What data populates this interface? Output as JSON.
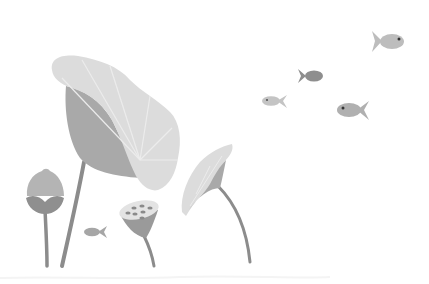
{
  "scene": {
    "description": "Grayscale illustration of lotus leaves, lotus bud, lotus seed pod and small fish",
    "background": "#ffffff",
    "colors": {
      "leaf_light": "#dcdcdc",
      "leaf_vein": "#ececec",
      "leaf_dark": "#a9a9a9",
      "stem": "#8c8c8c",
      "bud_top": "#b4b4b4",
      "bud_base": "#8f8f8f",
      "pod_top": "#e3e3e3",
      "pod_body": "#9a9a9a",
      "pod_seed": "#8a8a8a",
      "fish_light": "#bdbdbd",
      "fish_mid": "#b0b0b0",
      "fish_dark": "#8e8e8e",
      "fish_eye": "#333333"
    },
    "elements": [
      {
        "name": "large-lotus-leaf"
      },
      {
        "name": "lotus-bud"
      },
      {
        "name": "lotus-seed-pod"
      },
      {
        "name": "small-lotus-leaf"
      },
      {
        "name": "fish",
        "count": 5
      }
    ]
  }
}
